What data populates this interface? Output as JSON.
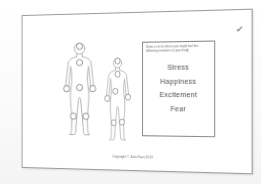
{
  "page": {
    "checkmark_glyph": "✓",
    "instruction_box": {
      "instruction": "Draw a circle where you might feel the following emotions in your body",
      "emotions": [
        "Stress",
        "Happiness",
        "Excitement",
        "Fear"
      ]
    },
    "figures": [
      {
        "name": "large",
        "description": "large human body outline, front view, with marker circles",
        "markers": [
          [
            30,
            6
          ],
          [
            30,
            28
          ],
          [
            30,
            62
          ],
          [
            11,
            63.5
          ],
          [
            49,
            63.5
          ],
          [
            21,
            101
          ],
          [
            39,
            101
          ]
        ]
      },
      {
        "name": "small",
        "description": "small human body outline, front view, with marker circles",
        "markers": [
          [
            30,
            6
          ],
          [
            30,
            26
          ],
          [
            26,
            52
          ],
          [
            11,
            63
          ],
          [
            49,
            61
          ],
          [
            23,
            100
          ],
          [
            38,
            99
          ]
        ]
      }
    ],
    "footer": "Copyright © Julia Ross 2013"
  },
  "colors": {
    "ink": "#a8a8a8",
    "marker-stroke": "#8c8c8c",
    "text": "#4f4f4f",
    "page-border": "#9a9a9a",
    "box-border": "#8c8c8c"
  }
}
